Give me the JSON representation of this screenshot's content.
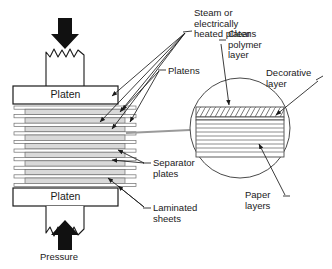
{
  "diagram": {
    "background": "#ffffff",
    "stroke": "#1a1a1a",
    "fill_laminate": "#d9d9d9",
    "fill_plate": "#ffffff",
    "arrow_fill": "#111111"
  },
  "labels": {
    "steam": "Steam or\nelectrically\nheated platens",
    "platens": "Platens",
    "clear_polymer": "Clear\npolymer\nlayer",
    "decorative": "Decorative\nlayer",
    "separator": "Separator\nplates",
    "laminated": "Laminated\nsheets",
    "paper": "Paper\nlayers",
    "pressure": "Pressure",
    "platen_top": "Platen",
    "platen_bottom": "Platen"
  },
  "press": {
    "platen_top_box": {
      "x": 13,
      "y": 86,
      "w": 105,
      "h": 18
    },
    "platen_bottom_box": {
      "x": 13,
      "y": 188,
      "w": 105,
      "h": 18
    },
    "ram_top": {
      "x": 46,
      "y": 47,
      "w": 38,
      "h": 39
    },
    "ram_bottom": {
      "x": 46,
      "y": 206,
      "w": 38,
      "h": 39
    },
    "stack_top": 106,
    "stack_bottom": 187,
    "laminate_count": 9,
    "separator_count": 10,
    "laminate_x": 25,
    "laminate_w": 100,
    "separator_x": 14,
    "separator_w": 122
  },
  "magnifier": {
    "center_x": 240,
    "center_y": 128,
    "radius": 50,
    "detail_x": 196,
    "detail_w": 88,
    "clear_polymer_band": {
      "y": 108,
      "h": 9,
      "hatch": "diagonal"
    },
    "decorative_band": {
      "y": 117,
      "h": 3
    },
    "paper_band": {
      "y": 120,
      "h": 36,
      "line_count": 9
    }
  }
}
